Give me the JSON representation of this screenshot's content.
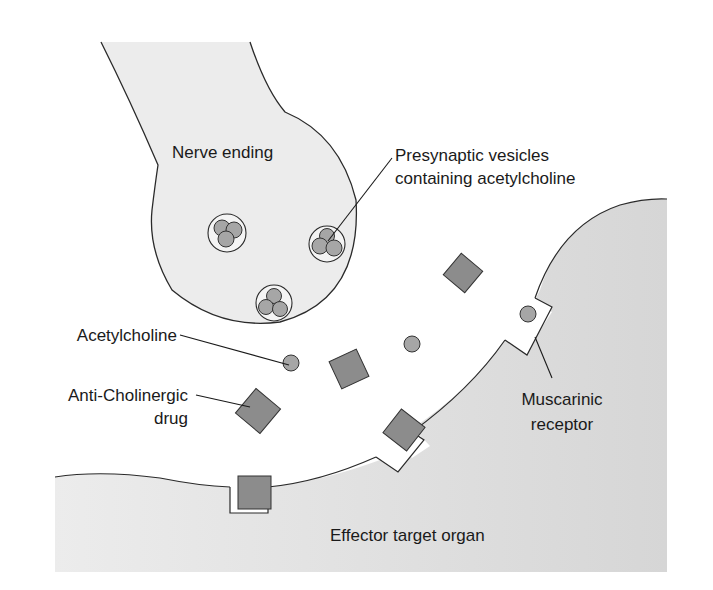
{
  "diagram": {
    "type": "synapse-schematic",
    "labels": {
      "nerve_ending": "Nerve ending",
      "vesicles_line1": "Presynaptic vesicles",
      "vesicles_line2": "containing acetylcholine",
      "acetylcholine": "Acetylcholine",
      "anticholinergic_line1": "Anti-Cholinergic",
      "anticholinergic_line2": "drug",
      "muscarinic_line1": "Muscarinic",
      "muscarinic_line2": "receptor",
      "effector": "Effector target organ"
    },
    "colors": {
      "background": "#ffffff",
      "nerve_fill": "#ebebeb",
      "organ_fill": "#dcdcdc",
      "molecule_fill": "#8c8c8c",
      "vesicle_ball_fill": "#a6a6a6",
      "outline": "#2a2a2a"
    }
  }
}
